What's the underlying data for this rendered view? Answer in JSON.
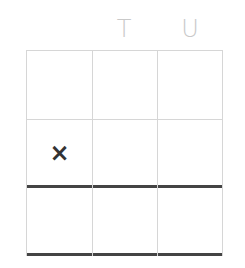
{
  "board": {
    "column_labels": [
      {
        "label": "",
        "x": 42
      },
      {
        "label": "T",
        "x": 109
      },
      {
        "label": "U",
        "x": 175
      }
    ],
    "rows": 3,
    "columns": 3,
    "cells": [
      [
        "",
        "",
        ""
      ],
      [
        "×",
        "",
        ""
      ],
      [
        "",
        "",
        ""
      ]
    ],
    "colors": {
      "grid_line": "#d6d6d6",
      "thick_line": "#444444",
      "label": "#c9c9c9",
      "mark": "#333333"
    }
  }
}
